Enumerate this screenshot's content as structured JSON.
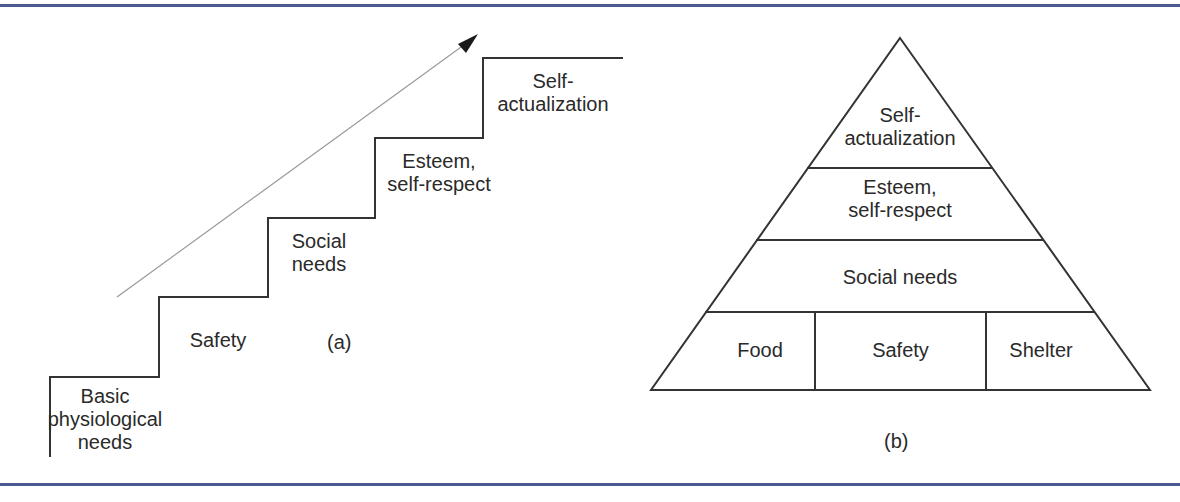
{
  "figure_a": {
    "caption": "(a)",
    "type": "staircase",
    "steps": [
      {
        "label": "Basic\nphysiological\nneeds"
      },
      {
        "label": "Safety"
      },
      {
        "label": "Social\nneeds"
      },
      {
        "label": "Esteem,\nself-respect"
      },
      {
        "label": "Self-\nactualization"
      }
    ],
    "arrow": "ascending-direction-arrow"
  },
  "figure_b": {
    "caption": "(b)",
    "type": "pyramid",
    "tiers": [
      {
        "label": "Self-\nactualization"
      },
      {
        "label": "Esteem,\nself-respect"
      },
      {
        "label": "Social needs"
      },
      {
        "cells": [
          {
            "label": "Food"
          },
          {
            "label": "Safety"
          },
          {
            "label": "Shelter"
          }
        ]
      }
    ]
  },
  "colors": {
    "rule": "#4a5a8e",
    "line": "#333333",
    "arrow": "#9a9a9a",
    "text": "#2a2a2a"
  }
}
